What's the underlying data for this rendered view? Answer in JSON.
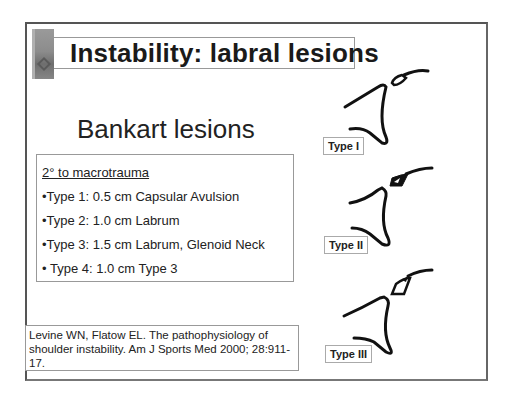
{
  "slide": {
    "title": "Instability: labral lesions",
    "subtitle": "Bankart lesions",
    "list": {
      "heading": "2° to macrotrauma",
      "items": [
        "•Type 1: 0.5 cm Capsular Avulsion",
        "•Type 2: 1.0 cm Labrum",
        "•Type 3: 1.5 cm Labrum, Glenoid Neck",
        "• Type 4: 1.0 cm Type 3"
      ]
    },
    "reference": "Levine WN, Flatow EL. The pathophysiology of shoulder instability. Am J Sports Med 2000; 28:911-17.",
    "diagrams": [
      {
        "label": "Type I"
      },
      {
        "label": "Type II"
      },
      {
        "label": "Type III"
      }
    ],
    "logo_icon": "hand-logo-icon"
  }
}
